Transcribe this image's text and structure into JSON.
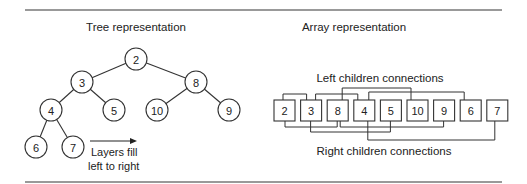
{
  "tree": {
    "title": "Tree representation",
    "nodes": [
      {
        "value": "2",
        "cx": 136,
        "cy": 59
      },
      {
        "value": "3",
        "cx": 82,
        "cy": 82
      },
      {
        "value": "8",
        "cx": 196,
        "cy": 82
      },
      {
        "value": "4",
        "cx": 51,
        "cy": 110
      },
      {
        "value": "5",
        "cx": 114,
        "cy": 110
      },
      {
        "value": "10",
        "cx": 157,
        "cy": 110
      },
      {
        "value": "9",
        "cx": 229,
        "cy": 110
      },
      {
        "value": "6",
        "cx": 36,
        "cy": 147
      },
      {
        "value": "7",
        "cx": 73,
        "cy": 147
      }
    ],
    "edges": [
      [
        0,
        1
      ],
      [
        0,
        2
      ],
      [
        1,
        3
      ],
      [
        1,
        4
      ],
      [
        2,
        5
      ],
      [
        2,
        6
      ],
      [
        3,
        7
      ],
      [
        3,
        8
      ]
    ],
    "annotation": {
      "line1": "Layers fill",
      "line2": "left to right"
    }
  },
  "array": {
    "title": "Array representation",
    "values": [
      "2",
      "3",
      "8",
      "4",
      "5",
      "10",
      "9",
      "6",
      "7"
    ],
    "left_label": "Left children connections",
    "right_label": "Right children connections",
    "left_connections": [
      [
        0,
        1
      ],
      [
        1,
        3
      ],
      [
        2,
        5
      ],
      [
        3,
        7
      ]
    ],
    "right_connections": [
      [
        0,
        2
      ],
      [
        1,
        4
      ],
      [
        2,
        6
      ],
      [
        3,
        8
      ]
    ]
  }
}
